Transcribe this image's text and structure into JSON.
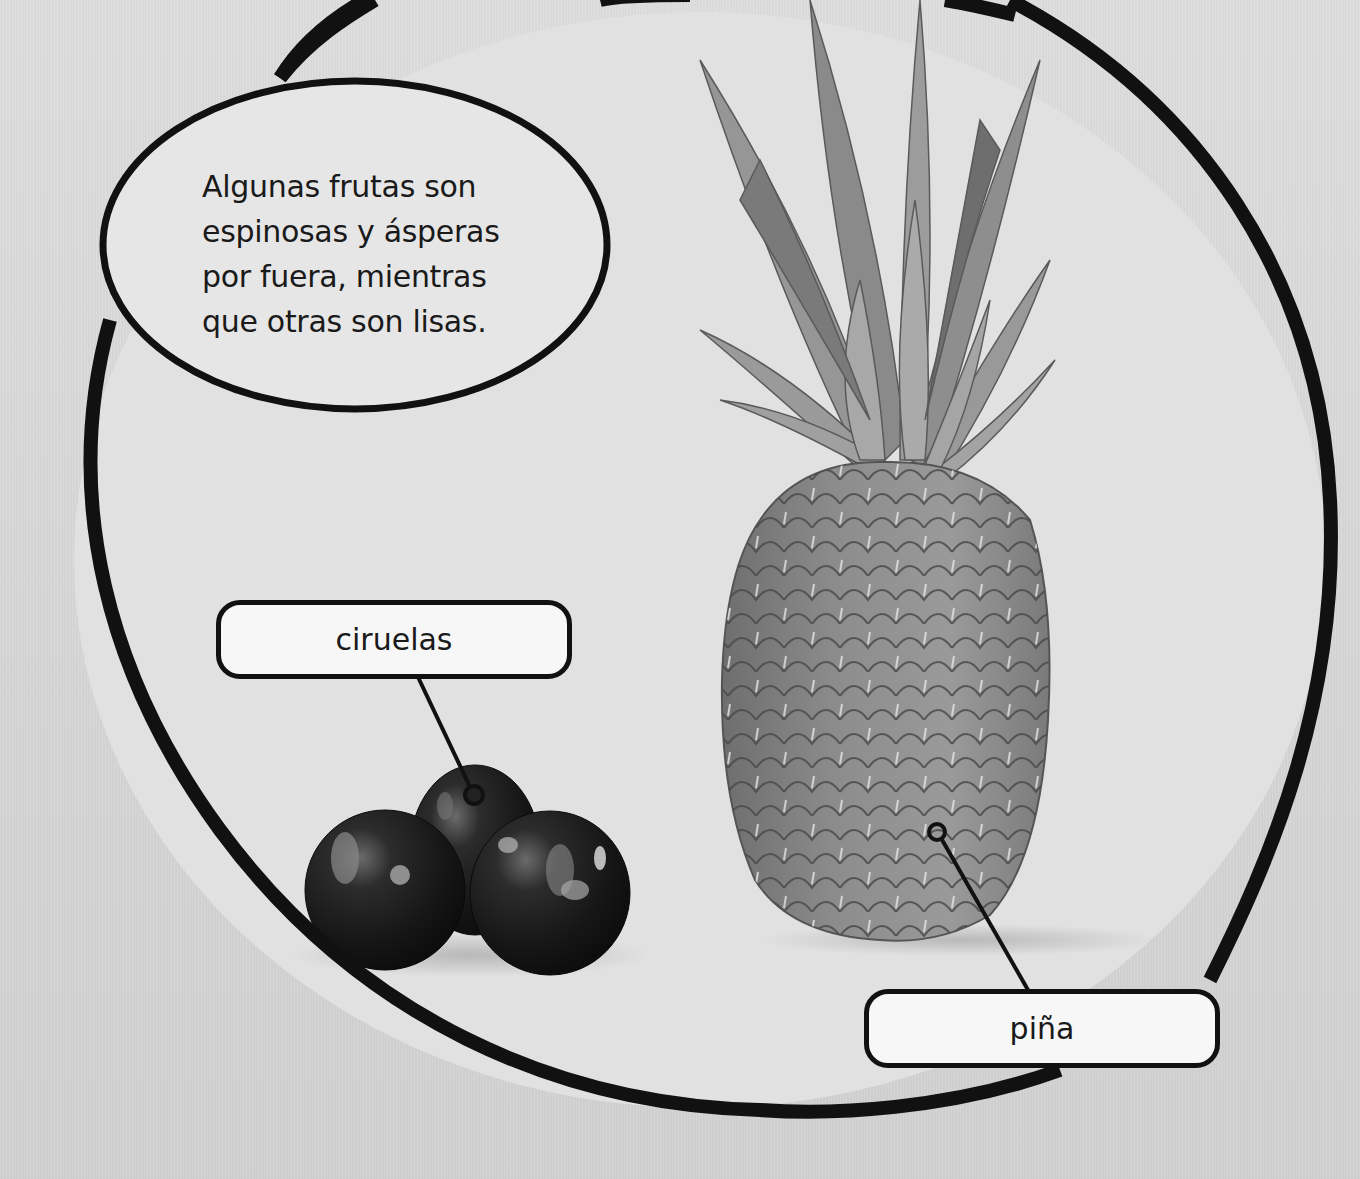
{
  "page": {
    "background_color": "#d9d9d9",
    "outline_color": "#111111"
  },
  "speech_bubble": {
    "lines": [
      "Algunas frutas son",
      "espinosas y ásperas",
      "por fuera, mientras",
      "que otras son lisas."
    ]
  },
  "labels": {
    "plums": {
      "text": "ciruelas",
      "pointer_target": "plums-image"
    },
    "pineapple": {
      "text": "piña",
      "pointer_target": "pineapple-image"
    }
  },
  "images": {
    "plums": {
      "description": "three dark glossy plums",
      "count": 3
    },
    "pineapple": {
      "description": "whole pineapple with leafy crown"
    }
  }
}
